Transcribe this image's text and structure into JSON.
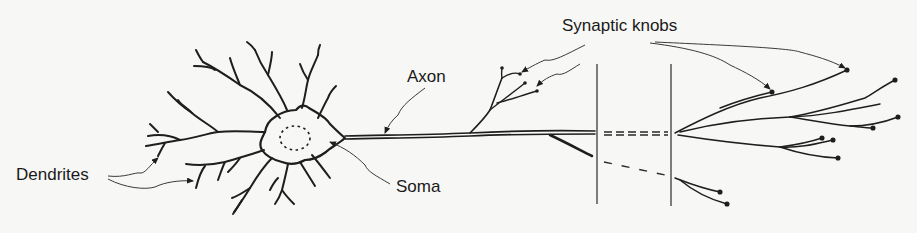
{
  "diagram": {
    "background_color": "#f7f7f5",
    "ink_color": "#1e1e1e",
    "labels": [
      {
        "id": "dendrites",
        "text": "Dendrites",
        "x": 16,
        "y": 166
      },
      {
        "id": "axon",
        "text": "Axon",
        "x": 407,
        "y": 68
      },
      {
        "id": "soma",
        "text": "Soma",
        "x": 396,
        "y": 178
      },
      {
        "id": "synaptic_knobs",
        "text": "Synaptic knobs",
        "x": 562,
        "y": 17
      }
    ],
    "parts": {
      "soma": "Cell body with dashed nucleus",
      "dendrites": "Branching processes around soma",
      "axon": "Long fiber extending right",
      "axon_break": "Two vertical lines indicating omitted length",
      "synaptic_knobs": "Terminal dots at axon branch ends"
    }
  }
}
